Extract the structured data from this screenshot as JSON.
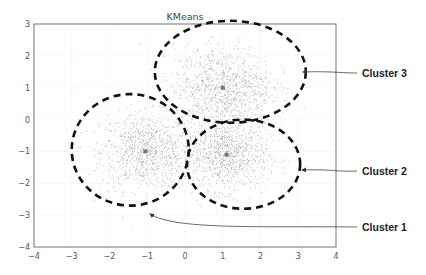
{
  "chart_data": {
    "type": "scatter",
    "title": "KMeans",
    "xlabel": "",
    "ylabel": "",
    "xlim": [
      -4,
      4
    ],
    "ylim": [
      -4,
      3
    ],
    "xticks": [
      -4,
      -3,
      -2,
      -1,
      0,
      1,
      2,
      3,
      4
    ],
    "yticks": [
      3,
      2,
      1,
      0,
      -1,
      -2,
      -3,
      -4
    ],
    "grid": true,
    "legend": null,
    "series": [
      {
        "name": "Cluster 1",
        "center": [
          -1.05,
          -1.0
        ],
        "std": 0.6,
        "n": 900
      },
      {
        "name": "Cluster 2",
        "center": [
          1.1,
          -1.1
        ],
        "std": 0.55,
        "n": 900
      },
      {
        "name": "Cluster 3",
        "center": [
          1.0,
          1.0
        ],
        "std": 0.65,
        "n": 1000
      }
    ],
    "annotations": [
      {
        "text": "Cluster 3",
        "ellipse_center": [
          1.2,
          1.5
        ],
        "ellipse_radii": [
          2.0,
          1.6
        ]
      },
      {
        "text": "Cluster 2",
        "ellipse_center": [
          1.55,
          -1.4
        ],
        "ellipse_radii": [
          1.5,
          1.4
        ]
      },
      {
        "text": "Cluster 1",
        "ellipse_center": [
          -1.45,
          -0.95
        ],
        "ellipse_radii": [
          1.55,
          1.75
        ]
      }
    ]
  },
  "colors": {
    "points": "#9a9a9a",
    "centers": "#777777",
    "dashed": "#111111",
    "axis": "#777777",
    "grid": "#e6e6e6"
  }
}
